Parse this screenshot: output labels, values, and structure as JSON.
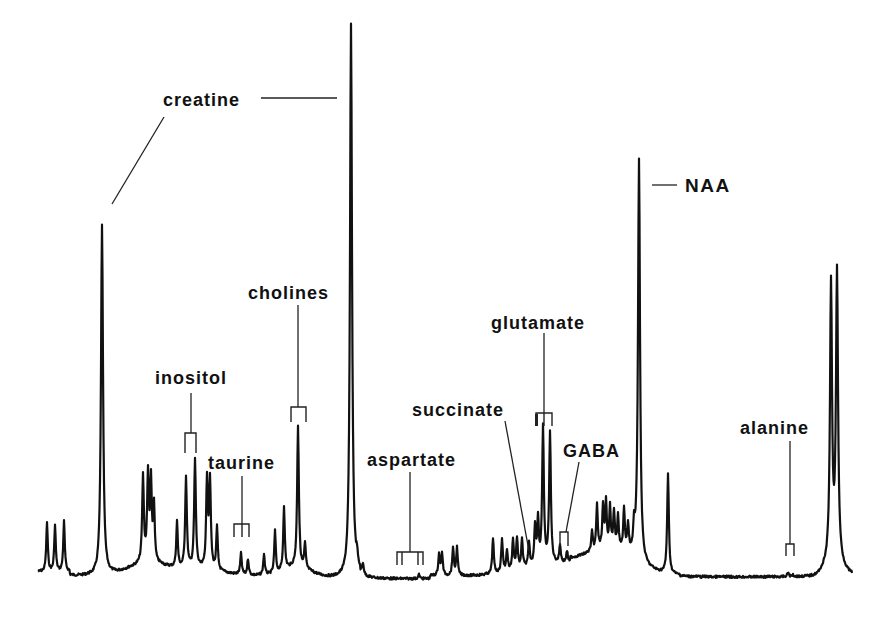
{
  "figure": {
    "background": "#ffffff",
    "ink": "#111111"
  },
  "chart_data": {
    "type": "line",
    "title": "",
    "subtitle": "1H NMR spectrum with metabolite assignments",
    "xlabel": "",
    "ylabel": "",
    "axes_visible": false,
    "grid": false,
    "legend": null,
    "baseline_px": 576,
    "peaks": [
      {
        "x": 47,
        "top": 523
      },
      {
        "x": 55,
        "top": 526
      },
      {
        "x": 64,
        "top": 522
      },
      {
        "x": 102,
        "top": 225
      },
      {
        "x": 143,
        "top": 490
      },
      {
        "x": 148,
        "top": 488
      },
      {
        "x": 151,
        "top": 497
      },
      {
        "x": 154,
        "top": 520
      },
      {
        "x": 177,
        "top": 530
      },
      {
        "x": 186,
        "top": 485
      },
      {
        "x": 195,
        "top": 467
      },
      {
        "x": 207,
        "top": 487
      },
      {
        "x": 210,
        "top": 490
      },
      {
        "x": 217,
        "top": 533
      },
      {
        "x": 241,
        "top": 555
      },
      {
        "x": 248,
        "top": 560
      },
      {
        "x": 264,
        "top": 555
      },
      {
        "x": 275,
        "top": 534
      },
      {
        "x": 284,
        "top": 512
      },
      {
        "x": 298,
        "top": 435
      },
      {
        "x": 305,
        "top": 553
      },
      {
        "x": 351,
        "top": 24
      },
      {
        "x": 357,
        "top": 565
      },
      {
        "x": 363,
        "top": 568
      },
      {
        "x": 419,
        "top": 575
      },
      {
        "x": 439,
        "top": 555
      },
      {
        "x": 442,
        "top": 553
      },
      {
        "x": 453,
        "top": 548
      },
      {
        "x": 457,
        "top": 548
      },
      {
        "x": 493,
        "top": 540
      },
      {
        "x": 502,
        "top": 542
      },
      {
        "x": 507,
        "top": 555
      },
      {
        "x": 513,
        "top": 545
      },
      {
        "x": 517,
        "top": 545
      },
      {
        "x": 522,
        "top": 548
      },
      {
        "x": 529,
        "top": 553
      },
      {
        "x": 535,
        "top": 537
      },
      {
        "x": 538,
        "top": 531
      },
      {
        "x": 543,
        "top": 440
      },
      {
        "x": 550,
        "top": 445
      },
      {
        "x": 560,
        "top": 558
      },
      {
        "x": 567,
        "top": 565
      },
      {
        "x": 592,
        "top": 553
      },
      {
        "x": 597,
        "top": 527
      },
      {
        "x": 603,
        "top": 530
      },
      {
        "x": 606,
        "top": 527
      },
      {
        "x": 610,
        "top": 532
      },
      {
        "x": 614,
        "top": 535
      },
      {
        "x": 618,
        "top": 540
      },
      {
        "x": 624,
        "top": 530
      },
      {
        "x": 628,
        "top": 545
      },
      {
        "x": 634,
        "top": 548
      },
      {
        "x": 639,
        "top": 173
      },
      {
        "x": 668,
        "top": 477
      },
      {
        "x": 788,
        "top": 573
      },
      {
        "x": 793,
        "top": 575
      },
      {
        "x": 831,
        "top": 300
      },
      {
        "x": 837,
        "top": 288
      }
    ],
    "annotations": [
      {
        "label": "creatine",
        "peaks_x": [
          102,
          351
        ],
        "text_x": 163,
        "text_y": 106
      },
      {
        "label": "cholines",
        "peak_x": 298,
        "text_x": 248,
        "text_y": 299
      },
      {
        "label": "inositol",
        "peak_x": 190,
        "text_x": 155,
        "text_y": 384
      },
      {
        "label": "taurine",
        "peak_x": 242,
        "text_x": 208,
        "text_y": 469
      },
      {
        "label": "aspartate",
        "peak_x": 409,
        "text_x": 367,
        "text_y": 466
      },
      {
        "label": "succinate",
        "peak_x": 529,
        "text_x": 412,
        "text_y": 416
      },
      {
        "label": "glutamate",
        "peak_x": 543,
        "text_x": 491,
        "text_y": 329
      },
      {
        "label": "GABA",
        "peak_x": 563,
        "text_x": 563,
        "text_y": 457
      },
      {
        "label": "NAA",
        "peak_x": 639,
        "text_x": 685,
        "text_y": 192
      },
      {
        "label": "alanine",
        "peak_x": 790,
        "text_x": 740,
        "text_y": 434
      }
    ]
  },
  "labels": {
    "creatine": "creatine",
    "cholines": "cholines",
    "inositol": "inositol",
    "taurine": "taurine",
    "aspartate": "aspartate",
    "succinate": "succinate",
    "glutamate": "glutamate",
    "gaba": "GABA",
    "naa": "NAA",
    "alanine": "alanine"
  }
}
